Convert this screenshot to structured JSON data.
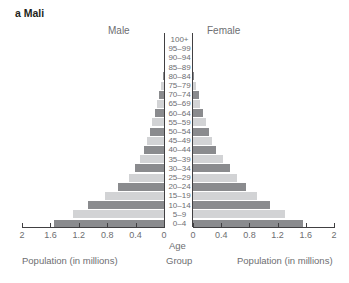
{
  "chart_data": {
    "type": "bar",
    "subtype": "population-pyramid",
    "title": "a Mali",
    "left_label": "Male",
    "right_label": "Female",
    "center_axis_label": "Age Group",
    "xlabel_left": "Population (in millions)",
    "xlabel_right": "Population (in millions)",
    "xlim": [
      0,
      2
    ],
    "x_ticks": [
      "2",
      "1.6",
      "1.2",
      "0.8",
      "0.4",
      "0"
    ],
    "x_ticks_right": [
      "0",
      "0.4",
      "0.8",
      "1.2",
      "1.6",
      "2"
    ],
    "categories": [
      "100+",
      "95–99",
      "90–94",
      "85–89",
      "80–84",
      "75–79",
      "70–74",
      "65–69",
      "60–64",
      "55–59",
      "50–54",
      "45–49",
      "40–44",
      "35–39",
      "30–34",
      "25–29",
      "20–24",
      "15–19",
      "10–14",
      "5–9",
      "0–4"
    ],
    "series": [
      {
        "name": "Male",
        "values": [
          0,
          0,
          0,
          0,
          0.02,
          0.04,
          0.07,
          0.1,
          0.13,
          0.17,
          0.2,
          0.24,
          0.28,
          0.34,
          0.41,
          0.49,
          0.65,
          0.83,
          1.07,
          1.28,
          1.55
        ]
      },
      {
        "name": "Female",
        "values": [
          0,
          0,
          0,
          0,
          0.02,
          0.04,
          0.08,
          0.1,
          0.14,
          0.18,
          0.23,
          0.27,
          0.33,
          0.42,
          0.52,
          0.62,
          0.75,
          0.9,
          1.09,
          1.29,
          1.55
        ]
      }
    ],
    "colors": {
      "dark": "#8a8b8e",
      "light": "#d2d3d5",
      "axis": "#414042",
      "text": "#6d6e71"
    },
    "grid": false
  }
}
